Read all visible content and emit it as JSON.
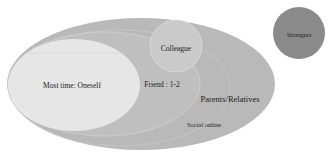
{
  "diagram": {
    "type": "social-relationship-venn",
    "colors": {
      "outer": "#b9b9b9",
      "friends": "#c2c2c2",
      "oneself": "#e6e6e6",
      "colleague": "#cdcdcd",
      "strangers": "#8a8a8a",
      "stroke": "#d8d8d8"
    },
    "labels": {
      "oneself": "Most time: Oneself",
      "friend": "Friend : 1-2",
      "colleague": "Colleague",
      "parents": "Parents/Relatives",
      "social": "Social online",
      "strangers": "Strangers"
    }
  }
}
